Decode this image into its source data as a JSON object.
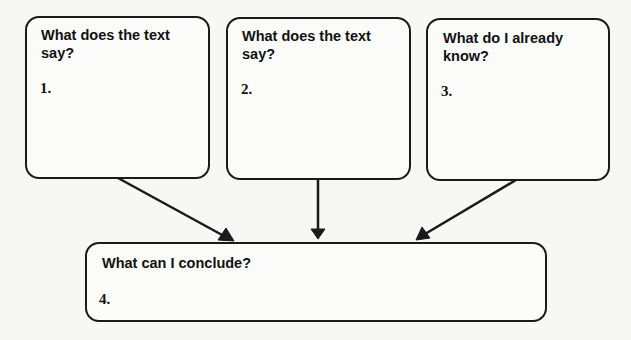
{
  "boxes": [
    {
      "question": "What does the text say?",
      "number": "1."
    },
    {
      "question": "What does the text say?",
      "number": "2."
    },
    {
      "question": "What do I already know?",
      "number": "3."
    },
    {
      "question": "What can I conclude?",
      "number": "4."
    }
  ],
  "colors": {
    "stroke": "#1a1a1a",
    "background": "#f7f7f5"
  }
}
